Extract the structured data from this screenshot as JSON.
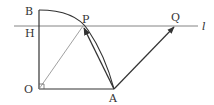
{
  "diagram": {
    "type": "geometry",
    "colors": {
      "stroke": "#333333",
      "thin_stroke": "#777777",
      "background": "#ffffff"
    },
    "points": {
      "O": {
        "label": "O",
        "x": 39,
        "y": 89
      },
      "B": {
        "label": "B",
        "x": 39,
        "y": 10
      },
      "H": {
        "label": "H",
        "x": 39,
        "y": 26
      },
      "P": {
        "label": "P",
        "x": 83,
        "y": 26
      },
      "A": {
        "label": "A",
        "x": 114,
        "y": 89
      },
      "Q": {
        "label": "Q",
        "x": 175,
        "y": 26
      }
    },
    "line_label": "l",
    "segments": [
      {
        "from": "O",
        "to": "B",
        "style": "solid"
      },
      {
        "from": "O",
        "to": "A",
        "style": "solid"
      },
      {
        "from": "O",
        "to": "P",
        "style": "thin"
      },
      {
        "from": "H",
        "to": "l-end",
        "style": "thin",
        "name": "line l"
      }
    ],
    "vectors": [
      {
        "from": "A",
        "to": "P"
      },
      {
        "from": "A",
        "to": "Q"
      }
    ],
    "arcs": [
      {
        "center": "O",
        "from": "B",
        "to": "A",
        "through": "P"
      }
    ],
    "markers": [
      {
        "type": "right-angle",
        "at": "O"
      }
    ]
  }
}
